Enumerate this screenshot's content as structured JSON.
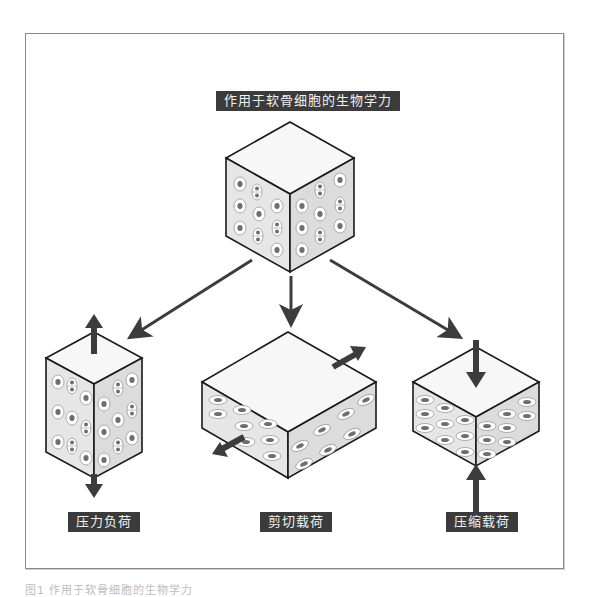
{
  "figure": {
    "title": "作用于软骨细胞的生物学力",
    "caption": "图1  作用于软骨细胞的生物学力",
    "colors": {
      "label_bg": "#3b3b3b",
      "label_text": "#f2f2f2",
      "cube_top": "#f7f7f7",
      "cube_left": "#e6e6e6",
      "cube_right": "#dcdcdc",
      "cube_edge": "#1a1a1a",
      "arrow": "#3c3c3c",
      "frame": "#8a8a8a"
    },
    "panels": [
      {
        "id": "tension",
        "label": "压力负荷",
        "shape": "tall-prism",
        "force_arrows": "up-and-down-outward"
      },
      {
        "id": "shear",
        "label": "剪切载荷",
        "shape": "flat-slab",
        "force_arrows": "opposite-horizontal"
      },
      {
        "id": "compression",
        "label": "压缩载荷",
        "shape": "short-cube",
        "force_arrows": "up-and-down-inward"
      }
    ],
    "connectors": [
      "top-cube-to-tension",
      "top-cube-to-shear",
      "top-cube-to-compression"
    ]
  }
}
